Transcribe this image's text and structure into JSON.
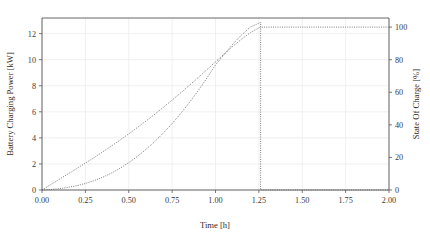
{
  "chart_data": {
    "type": "line",
    "title": "",
    "xlabel": "Time [h]",
    "ylabel": "Battery Charging Power [kW]",
    "y2label": "State Of Charge [%]",
    "xlim": [
      0.0,
      2.0
    ],
    "ylim": [
      0,
      13.2
    ],
    "y2lim": [
      0,
      105.6
    ],
    "grid": true,
    "legend": "none",
    "linestyle": "dotted",
    "line_color": "#6f6f6f",
    "xticks": [
      "0.00",
      "0.25",
      "0.50",
      "0.75",
      "1.00",
      "1.25",
      "1.50",
      "1.75",
      "2.00"
    ],
    "xtick_values": [
      0.0,
      0.25,
      0.5,
      0.75,
      1.0,
      1.25,
      1.5,
      1.75,
      2.0
    ],
    "yticks": [
      "0",
      "2",
      "4",
      "6",
      "8",
      "10",
      "12"
    ],
    "ytick_values": [
      0,
      2,
      4,
      6,
      8,
      10,
      12
    ],
    "y2ticks": [
      "0",
      "20",
      "40",
      "60",
      "80",
      "100"
    ],
    "y2tick_values": [
      0,
      20,
      40,
      60,
      80,
      100
    ],
    "charge_end_time": 1.26,
    "series": [
      {
        "name": "Battery Charging Power [kW]",
        "axis": "left",
        "x": [
          0.0,
          0.05,
          0.1,
          0.15,
          0.2,
          0.25,
          0.3,
          0.35,
          0.4,
          0.45,
          0.5,
          0.55,
          0.6,
          0.65,
          0.7,
          0.75,
          0.8,
          0.85,
          0.9,
          0.95,
          1.0,
          1.05,
          1.1,
          1.15,
          1.2,
          1.25,
          1.26,
          1.26,
          1.3,
          1.5,
          1.75,
          2.0
        ],
        "values": [
          0.0,
          0.04,
          0.1,
          0.2,
          0.33,
          0.5,
          0.72,
          0.98,
          1.3,
          1.67,
          2.1,
          2.58,
          3.12,
          3.72,
          4.38,
          5.1,
          5.88,
          6.72,
          7.62,
          8.58,
          9.6,
          10.4,
          11.2,
          11.9,
          12.5,
          12.8,
          12.85,
          0.0,
          0.0,
          0.0,
          0.0,
          0.0
        ]
      },
      {
        "name": "State Of Charge [%]",
        "axis": "right",
        "x": [
          0.0,
          0.05,
          0.1,
          0.15,
          0.2,
          0.25,
          0.3,
          0.35,
          0.4,
          0.45,
          0.5,
          0.55,
          0.6,
          0.65,
          0.7,
          0.75,
          0.8,
          0.85,
          0.9,
          0.95,
          1.0,
          1.05,
          1.1,
          1.15,
          1.2,
          1.25,
          1.26,
          1.5,
          1.75,
          2.0
        ],
        "values": [
          0.0,
          3.3,
          6.6,
          9.9,
          13.2,
          16.5,
          19.9,
          23.4,
          27.0,
          30.7,
          34.5,
          38.4,
          42.4,
          46.5,
          50.8,
          55.2,
          59.7,
          64.3,
          69.0,
          73.8,
          78.7,
          83.5,
          88.2,
          92.6,
          96.5,
          99.6,
          100.0,
          100.0,
          100.0,
          100.0
        ]
      }
    ]
  }
}
